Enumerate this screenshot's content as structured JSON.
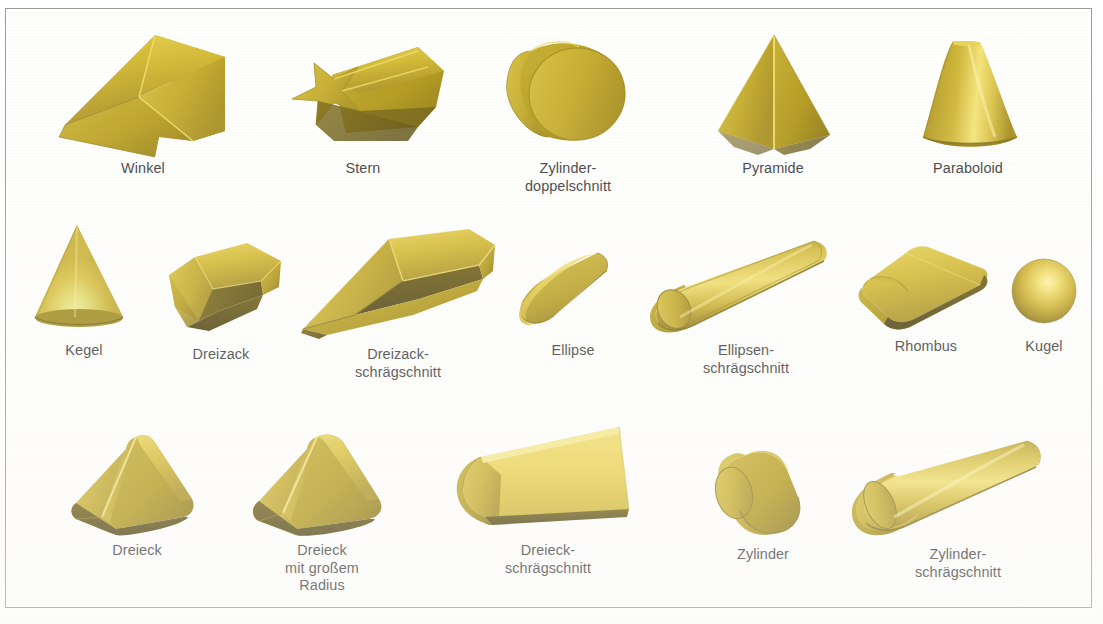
{
  "figure": {
    "background_color": "#ffffff",
    "frame_color": "#9a9a9c",
    "label_color": "#3b3b3d",
    "material_color": "#cbb12e",
    "material_highlight": "#f4e07a",
    "material_shadow": "#8a7318",
    "rows": [
      {
        "id": "row-1",
        "items": [
          {
            "name": "winkel",
            "label": "Winkel",
            "shape": "angle-extrusion"
          },
          {
            "name": "stern",
            "label": "Stern",
            "shape": "star-extrusion"
          },
          {
            "name": "zylinderdoppelschnitt",
            "label": "Zylinder-\ndoppelschnitt",
            "shape": "cylinder-double-cut"
          },
          {
            "name": "pyramide",
            "label": "Pyramide",
            "shape": "pyramid"
          },
          {
            "name": "paraboloid",
            "label": "Paraboloid",
            "shape": "paraboloid"
          }
        ]
      },
      {
        "id": "row-2",
        "items": [
          {
            "name": "kegel",
            "label": "Kegel",
            "shape": "cone"
          },
          {
            "name": "dreizack",
            "label": "Dreizack",
            "shape": "trident-short"
          },
          {
            "name": "dreizackschraegschnitt",
            "label": "Dreizack-\nschrägschnitt",
            "shape": "trident-bevel"
          },
          {
            "name": "ellipse",
            "label": "Ellipse",
            "shape": "ellipse-short"
          },
          {
            "name": "ellipsenschraegschnitt",
            "label": "Ellipsen-\nschrägschnitt",
            "shape": "ellipse-bevel"
          },
          {
            "name": "rhombus",
            "label": "Rhombus",
            "shape": "rhombus-plate"
          },
          {
            "name": "kugel",
            "label": "Kugel",
            "shape": "sphere"
          }
        ]
      },
      {
        "id": "row-3",
        "items": [
          {
            "name": "dreieck",
            "label": "Dreieck",
            "shape": "triangle-prism"
          },
          {
            "name": "dreieck-grosser-radius",
            "label": "Dreieck\nmit großem\nRadius",
            "shape": "triangle-prism-large-radius"
          },
          {
            "name": "dreieckschraegschnitt",
            "label": "Dreieck-\nschrägschnitt",
            "shape": "triangle-bevel"
          },
          {
            "name": "zylinder",
            "label": "Zylinder",
            "shape": "cylinder"
          },
          {
            "name": "zylinderschraegschnitt",
            "label": "Zylinder-\nschrägschnitt",
            "shape": "cylinder-bevel"
          }
        ]
      }
    ]
  }
}
